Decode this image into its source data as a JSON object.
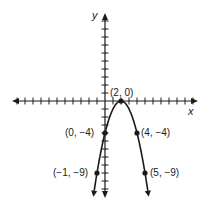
{
  "chart_data": {
    "type": "line",
    "title": "",
    "xlabel": "x",
    "ylabel": "y",
    "function": "y = -(x - 2)^2",
    "grid": false,
    "x_tick_range": [
      -11,
      11
    ],
    "y_tick_range": [
      -11,
      10
    ],
    "points": [
      {
        "x": 2,
        "y": 0,
        "label": "(2, 0)"
      },
      {
        "x": 0,
        "y": -4,
        "label": "(0, −4)"
      },
      {
        "x": 4,
        "y": -4,
        "label": "(4, −4)"
      },
      {
        "x": -1,
        "y": -9,
        "label": "(−1, −9)"
      },
      {
        "x": 5,
        "y": -9,
        "label": "(5, −9)"
      }
    ],
    "series": [
      {
        "name": "parabola",
        "x": [
          -1.4,
          -1,
          0,
          1,
          2,
          3,
          4,
          5,
          5.4
        ],
        "y": [
          -11.56,
          -9,
          -4,
          -1,
          0,
          -1,
          -4,
          -9,
          -11.56
        ]
      }
    ]
  },
  "labels": {
    "x_axis": "x",
    "y_axis": "y",
    "p_vertex": "(2, 0)",
    "p_left4": "(0, −4)",
    "p_right4": "(4, −4)",
    "p_left9": "(−1, −9)",
    "p_right9": "(5, −9)"
  },
  "colors": {
    "ink": "#1a1a1a",
    "background": "#ffffff"
  }
}
